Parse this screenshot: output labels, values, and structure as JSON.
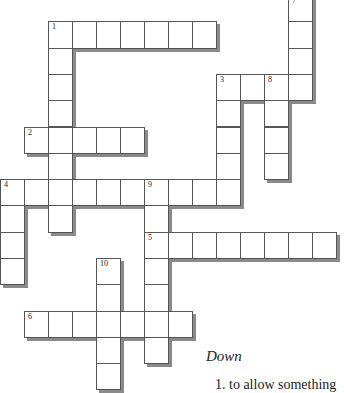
{
  "grid": {
    "cell_w": 24,
    "cell_h": 26.3,
    "origin_y": -5,
    "words": [
      {
        "number": "1",
        "dir": "across",
        "row": 1,
        "col": 2,
        "len": 7
      },
      {
        "number": "1",
        "dir": "down",
        "row": 1,
        "col": 2,
        "len": 8
      },
      {
        "number": "2",
        "dir": "across",
        "row": 5,
        "col": 1,
        "len": 5
      },
      {
        "number": "3",
        "dir": "across",
        "row": 3,
        "col": 9,
        "len": 4
      },
      {
        "number": "3",
        "dir": "down",
        "row": 3,
        "col": 9,
        "len": 5
      },
      {
        "number": "4",
        "dir": "across",
        "row": 7,
        "col": 0,
        "len": 10
      },
      {
        "number": "4",
        "dir": "down",
        "row": 7,
        "col": 0,
        "len": 4
      },
      {
        "number": "5",
        "dir": "across",
        "row": 9,
        "col": 6,
        "len": 8
      },
      {
        "number": "6",
        "dir": "across",
        "row": 12,
        "col": 1,
        "len": 7
      },
      {
        "number": "7",
        "dir": "down",
        "row": 0,
        "col": 12,
        "len": 4
      },
      {
        "number": "8",
        "dir": "down",
        "row": 3,
        "col": 11,
        "len": 4
      },
      {
        "number": "9",
        "dir": "down",
        "row": 7,
        "col": 6,
        "len": 7
      },
      {
        "number": "10",
        "dir": "down",
        "row": 10,
        "col": 4,
        "len": 5
      }
    ]
  },
  "clues": {
    "down_title": "Down",
    "down": [
      {
        "number": "1",
        "text": "1.  to allow something"
      }
    ]
  }
}
